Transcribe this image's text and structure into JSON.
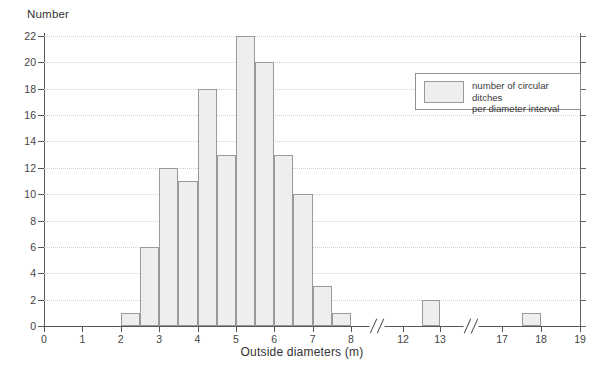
{
  "chart_data": {
    "type": "bar",
    "title": "",
    "xlabel": "Outside diameters (m)",
    "ylabel": "Number",
    "ylim": [
      0,
      22
    ],
    "ytick_step": 2,
    "ytick_labels": [
      "0",
      "2",
      "4",
      "6",
      "8",
      "10",
      "12",
      "14",
      "16",
      "18",
      "20",
      "22"
    ],
    "xtick_labels": [
      "0",
      "1",
      "2",
      "3",
      "4",
      "5",
      "6",
      "7",
      "8",
      "12",
      "13",
      "17",
      "18",
      "19"
    ],
    "x_axis_breaks": [
      {
        "after": 8,
        "before": 12
      },
      {
        "after": 13,
        "before": 17
      }
    ],
    "grid": "horizontal-dotted",
    "bin_width": 0.5,
    "bins": [
      {
        "start": 2.0,
        "end": 2.5,
        "value": 1
      },
      {
        "start": 2.5,
        "end": 3.0,
        "value": 6
      },
      {
        "start": 3.0,
        "end": 3.5,
        "value": 12
      },
      {
        "start": 3.5,
        "end": 4.0,
        "value": 11
      },
      {
        "start": 4.0,
        "end": 4.5,
        "value": 18
      },
      {
        "start": 4.5,
        "end": 5.0,
        "value": 13
      },
      {
        "start": 5.0,
        "end": 5.5,
        "value": 22
      },
      {
        "start": 5.5,
        "end": 6.0,
        "value": 20
      },
      {
        "start": 6.0,
        "end": 6.5,
        "value": 13
      },
      {
        "start": 6.5,
        "end": 7.0,
        "value": 10
      },
      {
        "start": 7.0,
        "end": 7.5,
        "value": 3
      },
      {
        "start": 7.5,
        "end": 8.0,
        "value": 1
      },
      {
        "start": 12.5,
        "end": 13.0,
        "value": 2
      },
      {
        "start": 17.5,
        "end": 18.0,
        "value": 1
      }
    ],
    "legend": {
      "position": "top-right",
      "entries": [
        {
          "label": "number of circular ditches\nper diameter interval",
          "fill": "#eeeeee",
          "stroke": "#9a9a9a"
        }
      ]
    },
    "colors": {
      "bar_fill": "#eeeeee",
      "bar_stroke": "#9a9a9a",
      "axis": "#555555",
      "grid": "#cfcfcf",
      "text": "#3a3a3a",
      "background": "#ffffff"
    }
  }
}
